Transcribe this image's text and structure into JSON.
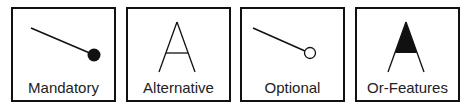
{
  "legend": {
    "items": [
      {
        "id": "mandatory",
        "label": "Mandatory",
        "symbol": "line-filled-circle"
      },
      {
        "id": "alternative",
        "label": "Alternative",
        "symbol": "open-arc"
      },
      {
        "id": "optional",
        "label": "Optional",
        "symbol": "line-open-circle"
      },
      {
        "id": "or-features",
        "label": "Or-Features",
        "symbol": "filled-arc"
      }
    ]
  },
  "colors": {
    "stroke": "#111111",
    "background": "#ffffff"
  }
}
